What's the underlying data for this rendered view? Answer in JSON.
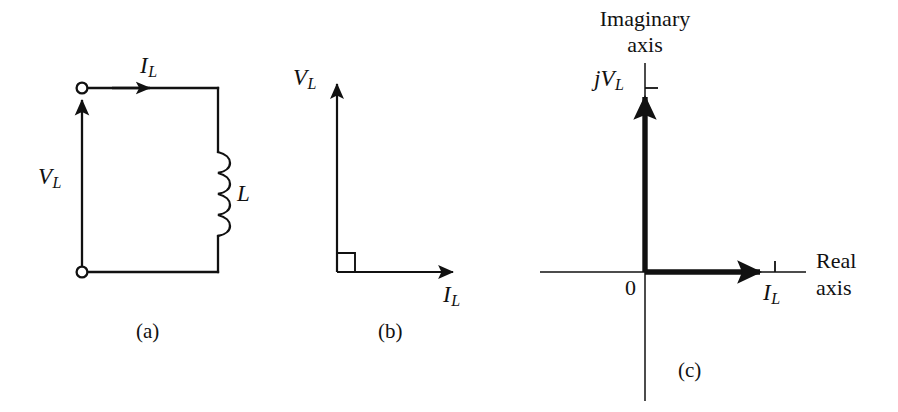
{
  "figure": {
    "background_color": "#ffffff",
    "line_color": "#111111",
    "panels": [
      {
        "id": "a",
        "caption": "(a)",
        "type": "circuit-schematic",
        "description": "Series loop with two open terminals on the left, current arrow along the top conductor, and an inductor on the right branch",
        "labels": {
          "current": "I",
          "current_sub": "L",
          "voltage": "V",
          "voltage_sub": "L",
          "component": "L"
        }
      },
      {
        "id": "b",
        "caption": "(b)",
        "type": "phasor-diagram",
        "description": "Voltage phasor leads current phasor by ninety degrees, right-angle marker at origin",
        "labels": {
          "vertical_axis": "V",
          "vertical_axis_sub": "L",
          "horizontal_axis": "I",
          "horizontal_axis_sub": "L"
        }
      },
      {
        "id": "c",
        "caption": "(c)",
        "type": "complex-plane",
        "description": "Complex plane with current phasor on the real axis and voltage phasor on the imaginary axis",
        "labels": {
          "imaginary_axis_line1": "Imaginary",
          "imaginary_axis_line2": "axis",
          "real_axis_line1": "Real",
          "real_axis_line2": "axis",
          "origin": "0",
          "imaginary_phasor": "jV",
          "imaginary_phasor_sub": "L",
          "real_phasor": "I",
          "real_phasor_sub": "L"
        }
      }
    ]
  }
}
